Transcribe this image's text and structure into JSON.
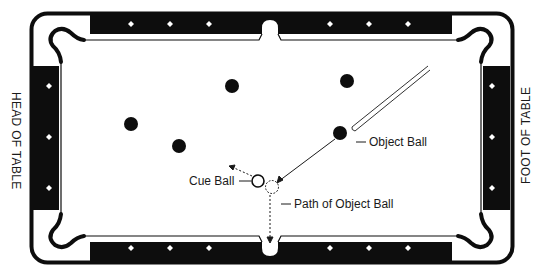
{
  "labels": {
    "head_of_table": "HEAD OF TABLE",
    "foot_of_table": "FOOT OF TABLE",
    "cue_ball": "Cue Ball",
    "object_ball": "Object Ball",
    "path_of_object_ball": "Path of Object Ball"
  },
  "colors": {
    "rail": "#0d0d0d",
    "cloth": "#ffffff",
    "diamond": "#ffffff",
    "ball": "#0d0d0d",
    "line": "#1a1a1a"
  },
  "table": {
    "diamonds_per_long_rail_half": 3,
    "diamonds_per_short_rail": 3,
    "pockets": [
      "top-left-corner",
      "top-side",
      "top-right-corner",
      "bottom-left-corner",
      "bottom-side",
      "bottom-right-corner"
    ]
  },
  "balls": [
    {
      "id": "ball-1",
      "type": "solid",
      "x": 131,
      "y": 124
    },
    {
      "id": "ball-2",
      "type": "solid",
      "x": 179,
      "y": 146
    },
    {
      "id": "ball-3",
      "type": "solid",
      "x": 232,
      "y": 86
    },
    {
      "id": "ball-4",
      "type": "solid",
      "x": 347,
      "y": 81
    },
    {
      "id": "object-ball",
      "type": "solid",
      "x": 340,
      "y": 133
    },
    {
      "id": "cue-ball",
      "type": "open",
      "x": 258,
      "y": 181
    },
    {
      "id": "ghost-ball",
      "type": "dashed",
      "x": 272,
      "y": 187
    }
  ]
}
